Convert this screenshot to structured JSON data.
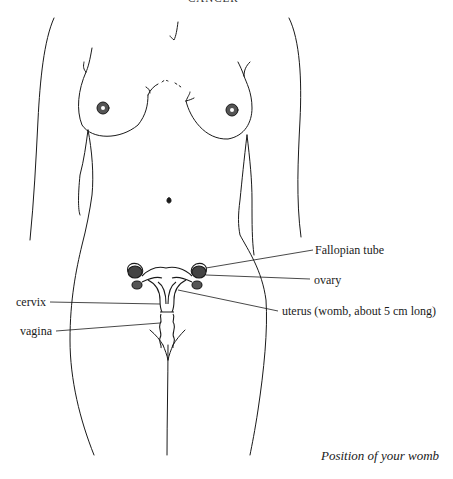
{
  "header": {
    "running_title": "CANCER"
  },
  "labels": {
    "fallopian_tube": "Fallopian tube",
    "ovary": "ovary",
    "uterus": "uterus (womb, about 5 cm long)",
    "cervix": "cervix",
    "vagina": "vagina"
  },
  "caption": "Position of your womb",
  "colors": {
    "line": "#1a1a1a",
    "background": "#ffffff"
  }
}
